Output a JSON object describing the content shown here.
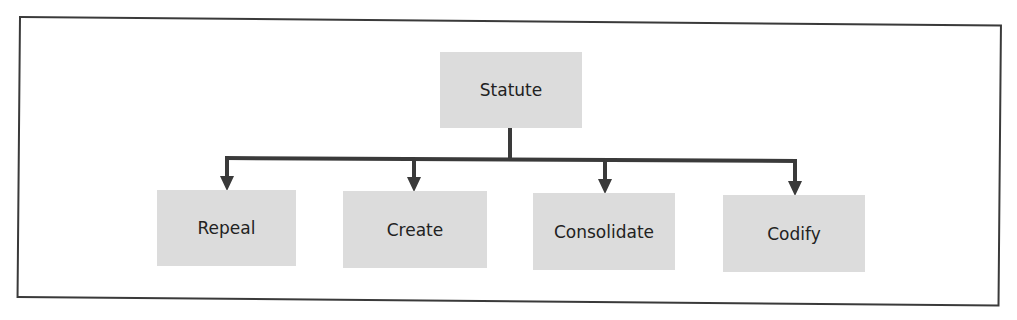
{
  "diagram": {
    "root": {
      "label": "Statute"
    },
    "children": [
      {
        "label": "Repeal"
      },
      {
        "label": "Create"
      },
      {
        "label": "Consolidate"
      },
      {
        "label": "Codify"
      }
    ]
  },
  "colors": {
    "node_fill": "#dcdcdc",
    "line": "#3a3a3a",
    "text": "#222222"
  }
}
